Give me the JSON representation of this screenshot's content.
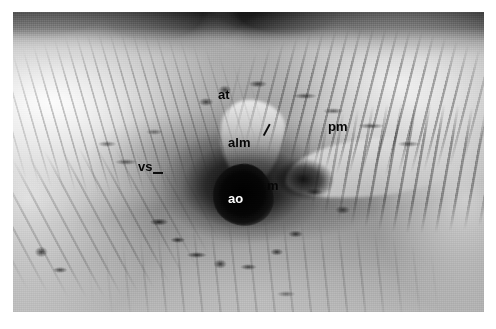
{
  "figure": {
    "domain": "Natural-Image",
    "kind": "anatomical-photograph",
    "modality": "grayscale-photograph",
    "border": {
      "color": "#ffffff",
      "left_px": 13,
      "top_px": 12,
      "right_px": 12,
      "bottom_px": 17
    },
    "plate": {
      "width_px": 471,
      "height_px": 300,
      "base_color": "#8d8d8d"
    }
  },
  "labels": [
    {
      "id": "at",
      "text": "at",
      "meaning": "anterior tricuspid / atrial structure",
      "color": "#0b0b0b",
      "style": "dark",
      "x": 218,
      "y": 88,
      "has_leader": false
    },
    {
      "id": "alm",
      "text": "alm",
      "meaning": "anterior leaflet of mitral valve",
      "color": "#0b0b0b",
      "style": "dark",
      "x": 228,
      "y": 136,
      "has_leader": true,
      "leader": {
        "x": 256,
        "y": 126,
        "length": 12,
        "angle": -62
      }
    },
    {
      "id": "pm",
      "text": "pm",
      "meaning": "papillary muscle",
      "color": "#0b0b0b",
      "style": "dark",
      "x": 328,
      "y": 120,
      "has_leader": false
    },
    {
      "id": "vs",
      "text": "vs",
      "meaning": "ventricular septum",
      "color": "#0b0b0b",
      "style": "dark",
      "x": 138,
      "y": 160,
      "has_leader": true,
      "leader": {
        "x": 153,
        "y": 172,
        "length": 9,
        "angle": 0
      }
    },
    {
      "id": "ao",
      "text": "ao",
      "meaning": "aortic orifice",
      "color": "#f7f7f7",
      "style": "light",
      "x": 228,
      "y": 192,
      "has_leader": false
    },
    {
      "id": "m",
      "text": "m",
      "meaning": "mitral valve orifice",
      "color": "#0b0b0b",
      "style": "dark",
      "x": 267,
      "y": 179,
      "has_leader": false
    }
  ]
}
